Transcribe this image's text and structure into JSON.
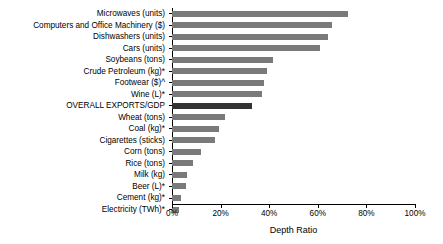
{
  "chart_data": {
    "type": "bar",
    "orientation": "horizontal",
    "title": "",
    "xlabel": "Depth Ratio",
    "ylabel": "",
    "xlim": [
      0,
      100
    ],
    "xunit": "%",
    "grid": false,
    "legend": null,
    "xticks": [
      {
        "value": 0,
        "label": "0%"
      },
      {
        "value": 20,
        "label": "20%"
      },
      {
        "value": 40,
        "label": "40%"
      },
      {
        "value": 60,
        "label": "60%"
      },
      {
        "value": 80,
        "label": "80%"
      },
      {
        "value": 100,
        "label": "100%"
      }
    ],
    "categories": [
      "Microwaves (units)",
      "Computers and Office Machinery ($)",
      "Dishwashers (units)",
      "Cars (units)",
      "Soybeans (tons)",
      "Crude Petroleum (kg)*",
      "Footwear ($)^",
      "Wine (L)*",
      "OVERALL EXPORTS/GDP",
      "Wheat (tons)",
      "Coal (kg)*",
      "Cigarettes (sticks)",
      "Corn (tons)",
      "Rice (tons)",
      "Milk (kg)",
      "Beer (L)*",
      "Cement (kg)*",
      "Electricity (TWh)*"
    ],
    "values": [
      72.4,
      65.8,
      64.0,
      61.0,
      41.5,
      39.0,
      38.0,
      37.0,
      33.0,
      22.0,
      19.5,
      17.5,
      12.0,
      8.6,
      6.2,
      5.8,
      3.7,
      2.9
    ],
    "highlight_index": 8,
    "colors": {
      "bar": "#7a7a7a",
      "bar_highlight": "#333333",
      "axis": "#000000",
      "background": "#ffffff"
    }
  }
}
